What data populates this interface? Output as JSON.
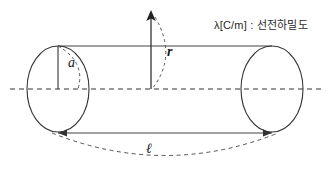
{
  "figure": {
    "annotation": "λ[C/m] : 선전하밀도",
    "labels": {
      "radius_inner": "a",
      "radius_outer": "r",
      "length": "ℓ"
    },
    "colors": {
      "stroke": "#333333",
      "background": "#ffffff",
      "text": "#1a1a1a"
    },
    "geometry": {
      "left_ellipse_center_x": 58,
      "left_ellipse_center_y": 89,
      "right_ellipse_center_x": 272,
      "right_ellipse_center_y": 89,
      "ellipse_rx": 31,
      "ellipse_ry": 43,
      "top_edge_y": 46,
      "bottom_edge_y": 133,
      "axis_y": 89,
      "axis_start_x": 10,
      "axis_end_x": 324,
      "r_arrow_x": 151,
      "r_arrow_top_y": 12
    }
  }
}
